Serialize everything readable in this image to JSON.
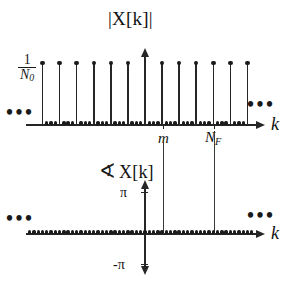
{
  "figure": {
    "caption": "DFT magnitude and phase spectrum of a sampled sinusoid"
  },
  "magnitude_plot": {
    "title": "|X[k]|",
    "y_tick_label_numerator": "1",
    "y_tick_label_denominator": "N",
    "y_tick_label_denominator_sub": "0",
    "x_axis_label": "k",
    "x_tick_labels": [
      {
        "text": "m",
        "sub": ""
      },
      {
        "text": "N",
        "sub": "F"
      }
    ],
    "left_ellipsis": "•••",
    "right_ellipsis": "•••"
  },
  "phase_plot": {
    "angle_symbol": "∢",
    "title": "X[k]",
    "y_tick_top": "π",
    "y_tick_bottom": "-π",
    "x_axis_label": "k",
    "left_ellipsis": "•••",
    "right_ellipsis": "•••"
  },
  "chart_data": {
    "type": "line",
    "subplots": [
      {
        "name": "magnitude",
        "type": "bar",
        "title": "|X[k]|",
        "xlabel": "k",
        "ylabel": "1/N_0",
        "ylim": [
          0,
          1
        ],
        "x": [
          -24,
          -20,
          -16,
          -12,
          -8,
          -4,
          0,
          4,
          8,
          12,
          16,
          20,
          24
        ],
        "values": [
          1,
          1,
          1,
          1,
          1,
          1,
          1,
          1,
          1,
          1,
          1,
          1,
          1
        ],
        "zero_values_between_peaks": 3,
        "comb_period": 4,
        "annotations": [
          {
            "label": "m",
            "x": 4
          },
          {
            "label": "N_F",
            "x": 16
          }
        ],
        "grid": false,
        "note": "Impulse train of equal height 1/N_0 spaced every 4 samples; zero-valued samples in between"
      },
      {
        "name": "phase",
        "type": "scatter",
        "title": "∢X[k]",
        "xlabel": "k",
        "ylabel": "phase",
        "ylim": [
          -3.14159,
          3.14159
        ],
        "ytick_labels": [
          "-π",
          "π"
        ],
        "x": [
          -28,
          -27,
          -26,
          -25,
          -24,
          -23,
          -22,
          -21,
          -20,
          -19,
          -18,
          -17,
          -16,
          -15,
          -14,
          -13,
          -12,
          -11,
          -10,
          -9,
          -8,
          -7,
          -6,
          -5,
          -4,
          -3,
          -2,
          -1,
          0,
          1,
          2,
          3,
          4,
          5,
          6,
          7,
          8,
          9,
          10,
          11,
          12,
          13,
          14,
          15,
          16,
          17,
          18,
          19,
          20,
          21,
          22,
          23,
          24,
          25,
          26,
          27,
          28
        ],
        "values": [
          0,
          0,
          0,
          0,
          0,
          0,
          0,
          0,
          0,
          0,
          0,
          0,
          0,
          0,
          0,
          0,
          0,
          0,
          0,
          0,
          0,
          0,
          0,
          0,
          0,
          0,
          0,
          0,
          0,
          0,
          0,
          0,
          0,
          0,
          0,
          0,
          0,
          0,
          0,
          0,
          0,
          0,
          0,
          0,
          0,
          0,
          0,
          0,
          0,
          0,
          0,
          0,
          0,
          0,
          0,
          0,
          0
        ],
        "annotations": [
          {
            "label": "m",
            "x": 4
          },
          {
            "label": "N_F",
            "x": 16
          }
        ],
        "grid": false,
        "note": "Phase is identically zero for all k"
      }
    ]
  },
  "colors": {
    "ink": "#1a1a1a",
    "background": "#ffffff"
  }
}
